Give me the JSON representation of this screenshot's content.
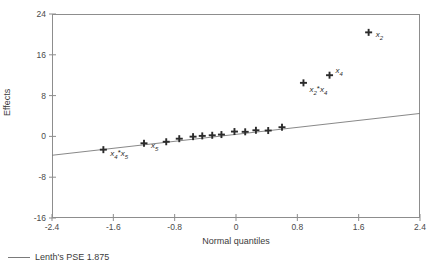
{
  "chart_data": {
    "type": "scatter",
    "title": "",
    "xlabel": "Normal quantiles",
    "ylabel": "Effects",
    "xlim": [
      -2.4,
      2.4
    ],
    "ylim": [
      -16,
      24
    ],
    "grid": false,
    "xticks": [
      "-2.4",
      "-1.6",
      "-0.8",
      "0",
      "0.8",
      "1.6",
      "2.4"
    ],
    "xtick_values": [
      -2.4,
      -1.6,
      -0.8,
      0,
      0.8,
      1.6,
      2.4
    ],
    "yticks": [
      "24",
      "16",
      "8",
      "0",
      "-8",
      "-16"
    ],
    "ytick_values": [
      24,
      16,
      8,
      0,
      -8,
      -16
    ],
    "legend": {
      "position": "below-axes-left",
      "entries": [
        {
          "label": "Lenth's PSE 1.875",
          "marker": "line",
          "color": "#7a7a7a"
        }
      ]
    },
    "marker": {
      "shape": "plus-bold",
      "color": "#2b2b2b",
      "size": 7
    },
    "reference_line": {
      "name": "lenth-pse-line",
      "color": "#7a7a7a",
      "x": [
        -2.4,
        2.4
      ],
      "y": [
        -3.7,
        4.5
      ]
    },
    "points": [
      {
        "x": -1.73,
        "y": -2.6,
        "label": "x4*x5",
        "label_pos": "right"
      },
      {
        "x": -1.2,
        "y": -1.35,
        "label": "x5",
        "label_pos": "right"
      },
      {
        "x": -0.91,
        "y": -1.05,
        "label": "",
        "label_pos": ""
      },
      {
        "x": -0.74,
        "y": -0.45,
        "label": "",
        "label_pos": ""
      },
      {
        "x": -0.56,
        "y": -0.05,
        "label": "",
        "label_pos": ""
      },
      {
        "x": -0.44,
        "y": 0.1,
        "label": "",
        "label_pos": ""
      },
      {
        "x": -0.31,
        "y": 0.22,
        "label": "",
        "label_pos": ""
      },
      {
        "x": -0.19,
        "y": 0.36,
        "label": "",
        "label_pos": ""
      },
      {
        "x": -0.02,
        "y": 0.95,
        "label": "",
        "label_pos": ""
      },
      {
        "x": 0.12,
        "y": 0.9,
        "label": "",
        "label_pos": ""
      },
      {
        "x": 0.26,
        "y": 1.2,
        "label": "",
        "label_pos": ""
      },
      {
        "x": 0.42,
        "y": 1.15,
        "label": "",
        "label_pos": ""
      },
      {
        "x": 0.6,
        "y": 1.8,
        "label": "",
        "label_pos": ""
      },
      {
        "x": 0.88,
        "y": 10.5,
        "label": "x2*x4",
        "label_pos": "below-right"
      },
      {
        "x": 1.22,
        "y": 12.0,
        "label": "x4",
        "label_pos": "above-right"
      },
      {
        "x": 1.73,
        "y": 20.4,
        "label": "x2",
        "label_pos": "right"
      }
    ]
  },
  "labels": {
    "x4_x5": {
      "base1": "x",
      "sub1": "4",
      "op": "*",
      "base2": "x",
      "sub2": "5"
    },
    "x5": {
      "base1": "x",
      "sub1": "5"
    },
    "x2_x4": {
      "base1": "x",
      "sub1": "2",
      "op": "*",
      "base2": "x",
      "sub2": "4"
    },
    "x4": {
      "base1": "x",
      "sub1": "4"
    },
    "x2": {
      "base1": "x",
      "sub1": "2"
    }
  }
}
